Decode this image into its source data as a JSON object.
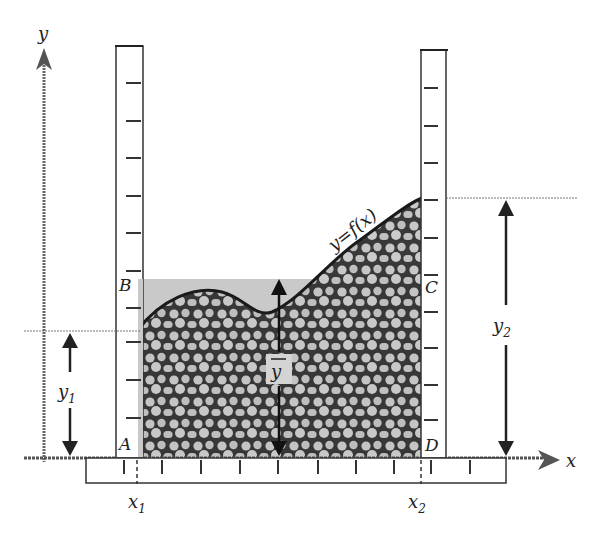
{
  "diagram": {
    "labels": {
      "y_axis": "y",
      "x_axis": "x",
      "curve": "y=f(x)",
      "point_A": "A",
      "point_B": "B",
      "point_C": "C",
      "point_D": "D",
      "x1": "x",
      "x1_sub": "1",
      "x2": "x",
      "x2_sub": "2",
      "y1": "y",
      "y1_sub": "1",
      "y2": "y",
      "y2_sub": "2",
      "ybar": "y"
    },
    "colors": {
      "ink": "#222222",
      "mean_fill": "#c8c8c8",
      "pebble_fill": "#bdbdbd",
      "pebble_outline": "#2a2a2a",
      "background": "#ffffff"
    },
    "elements": [
      "y-axis arrow",
      "x-axis arrow",
      "left vertical ruler at x1",
      "right vertical ruler at x2",
      "bottom horizontal ruler",
      "pebble-filled region under curve",
      "shaded rectangle ABCD at mean height",
      "y1 dimension arrow",
      "y2 dimension arrow",
      "y-bar dimension arrow"
    ]
  }
}
